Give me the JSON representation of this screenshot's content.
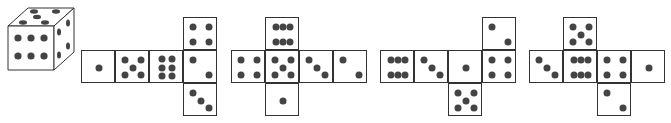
{
  "figure": {
    "cube": {
      "top": 5,
      "front": 6,
      "right": 4
    },
    "nets": [
      {
        "label": "net-1",
        "left": 81,
        "top": 17,
        "faces": [
          {
            "col": 0,
            "row": 1,
            "value": 1
          },
          {
            "col": 1,
            "row": 1,
            "value": 5
          },
          {
            "col": 2,
            "row": 1,
            "value": 6
          },
          {
            "col": 3,
            "row": 1,
            "value": 2
          },
          {
            "col": 3,
            "row": 0,
            "value": 4
          },
          {
            "col": 3,
            "row": 2,
            "value": 3
          }
        ]
      },
      {
        "label": "net-2",
        "left": 231,
        "top": 17,
        "faces": [
          {
            "col": 0,
            "row": 1,
            "value": 4
          },
          {
            "col": 1,
            "row": 1,
            "value": 5
          },
          {
            "col": 2,
            "row": 1,
            "value": 3
          },
          {
            "col": 3,
            "row": 1,
            "value": 2
          },
          {
            "col": 1,
            "row": 0,
            "value": 6
          },
          {
            "col": 1,
            "row": 2,
            "value": 1
          }
        ]
      },
      {
        "label": "net-3",
        "left": 380,
        "top": 17,
        "faces": [
          {
            "col": 0,
            "row": 1,
            "value": 6
          },
          {
            "col": 1,
            "row": 1,
            "value": 3
          },
          {
            "col": 2,
            "row": 1,
            "value": 1
          },
          {
            "col": 3,
            "row": 1,
            "value": 4
          },
          {
            "col": 3,
            "row": 0,
            "value": 2
          },
          {
            "col": 2,
            "row": 2,
            "value": 5
          }
        ]
      },
      {
        "label": "net-4",
        "left": 529,
        "top": 17,
        "faces": [
          {
            "col": 0,
            "row": 1,
            "value": 3
          },
          {
            "col": 1,
            "row": 1,
            "value": 6
          },
          {
            "col": 2,
            "row": 1,
            "value": 4
          },
          {
            "col": 3,
            "row": 1,
            "value": 1
          },
          {
            "col": 1,
            "row": 0,
            "value": 5
          },
          {
            "col": 2,
            "row": 2,
            "value": 2
          }
        ]
      }
    ],
    "colors": {
      "pip": "#444444",
      "line": "#333333",
      "background": "#ffffff"
    }
  }
}
